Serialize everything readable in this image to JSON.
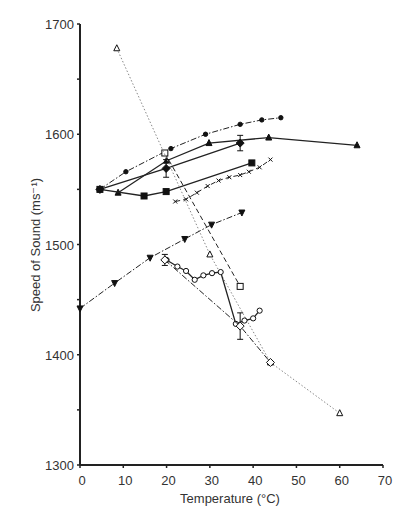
{
  "chart_data": {
    "type": "line",
    "title": "",
    "xlabel": "Temperature (°C)",
    "ylabel": "Speed of Sound (ms⁻¹)",
    "xlim": [
      0,
      70
    ],
    "ylim": [
      1300,
      1700
    ],
    "xticks": [
      0,
      10,
      20,
      30,
      40,
      50,
      60,
      70
    ],
    "yticks": [
      1300,
      1400,
      1500,
      1600,
      1700
    ],
    "ytick_labels_shown": [
      1300,
      1400,
      1500,
      1600,
      1700
    ],
    "grid": false,
    "legend": "none",
    "series": [
      {
        "name": "filled-circle",
        "marker": "circle-filled",
        "line": "dashdot",
        "x": [
          4.6,
          10.6,
          21,
          29,
          37,
          42,
          46.4
        ],
        "y": [
          1550,
          1566,
          1587,
          1600,
          1609,
          1613,
          1615
        ]
      },
      {
        "name": "filled-triangle-up",
        "marker": "triangle-up-filled",
        "line": "solid",
        "x": [
          8.8,
          20,
          29.8,
          43.6,
          64
        ],
        "y": [
          1547,
          1576,
          1592,
          1597,
          1590
        ]
      },
      {
        "name": "filled-diamond",
        "marker": "diamond-filled",
        "line": "solid",
        "x": [
          4.6,
          19.9,
          37
        ],
        "y": [
          1550,
          1569,
          1592
        ],
        "error": [
          0,
          8,
          7
        ]
      },
      {
        "name": "filled-square",
        "marker": "square-filled",
        "line": "solid",
        "x": [
          4.6,
          14.8,
          19.9,
          39.7
        ],
        "y": [
          1550,
          1544,
          1548,
          1574
        ]
      },
      {
        "name": "cross",
        "marker": "x",
        "line": "dashed",
        "x": [
          22,
          24.5,
          27,
          29.5,
          32,
          34.5,
          37,
          39,
          41.5,
          44
        ],
        "y": [
          1539,
          1541,
          1547,
          1553,
          1558,
          1561,
          1563,
          1566,
          1570,
          1577
        ]
      },
      {
        "name": "filled-triangle-down",
        "marker": "triangle-down-filled",
        "line": "dashdot",
        "x": [
          0,
          8,
          16.2,
          24.2,
          30.4,
          37.4
        ],
        "y": [
          1442,
          1465,
          1488,
          1505,
          1518,
          1529
        ]
      },
      {
        "name": "open-square",
        "marker": "square-open",
        "line": "dashed",
        "x": [
          19.6,
          37
        ],
        "y": [
          1583,
          1462
        ]
      },
      {
        "name": "open-triangle-up",
        "marker": "triangle-up-open",
        "line": "dotted",
        "x": [
          8.5,
          30,
          44,
          60
        ],
        "y": [
          1678,
          1491,
          1393,
          1347
        ]
      },
      {
        "name": "open-circle",
        "marker": "circle-open",
        "line": "solid",
        "x": [
          20,
          22.5,
          24.5,
          26.5,
          28.5,
          30.5,
          32.5,
          36,
          38,
          40,
          41.5
        ],
        "y": [
          1486,
          1480,
          1476,
          1468,
          1472,
          1474,
          1475,
          1428,
          1431,
          1433,
          1440
        ]
      },
      {
        "name": "open-diamond",
        "marker": "diamond-open",
        "line": "dashdot",
        "x": [
          19.6,
          37,
          44
        ],
        "y": [
          1486,
          1426,
          1393
        ],
        "error": [
          5,
          12,
          0
        ]
      }
    ]
  }
}
